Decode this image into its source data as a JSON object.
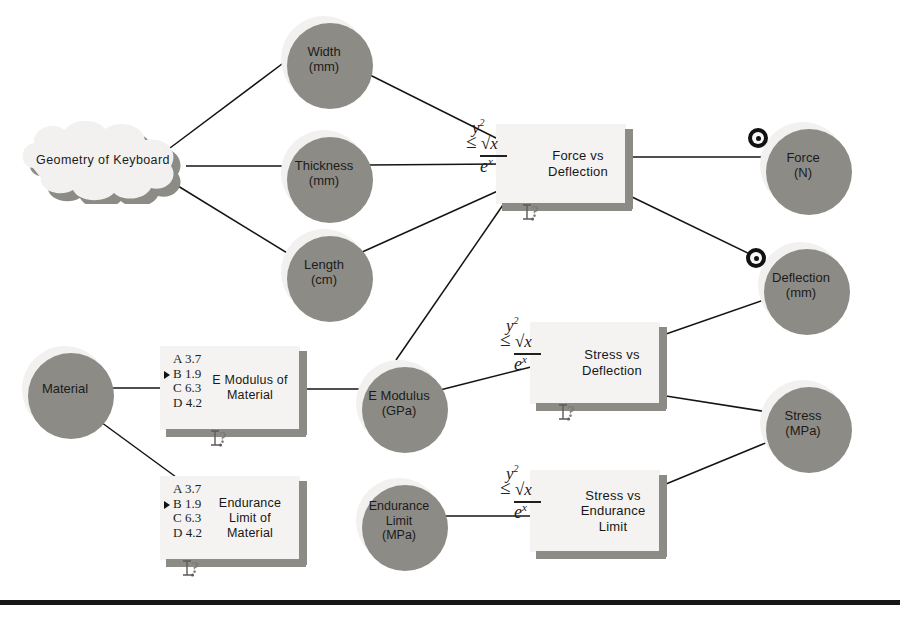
{
  "diagram": {
    "bottom_rule_y": 600,
    "colors": {
      "node_fill": "#f2f1ef",
      "shadow": "#8d8b86",
      "edge": "#141414",
      "text": "#1b1b1b",
      "rule": "#161616"
    },
    "icons": {
      "equation": {
        "name": "equation-icon",
        "numerator_left": "y",
        "numerator_sup": "2",
        "relation": "≤",
        "radical": "√",
        "radicand": "x",
        "denominator": "e",
        "denominator_sup": "x"
      },
      "option_list": {
        "name": "option-list-icon",
        "options": [
          {
            "letter": "A",
            "value": "3.7",
            "selected": false
          },
          {
            "letter": "B",
            "value": "1.9",
            "selected": true
          },
          {
            "letter": "C",
            "value": "6.3",
            "selected": false
          },
          {
            "letter": "D",
            "value": "4.2",
            "selected": false
          }
        ]
      },
      "help": {
        "name": "help-cursor-icon",
        "glyph": "?"
      },
      "target": {
        "name": "target-icon"
      }
    },
    "cloud_nodes": [
      {
        "id": "geometry",
        "name": "node-geometry-of-keyboard",
        "label": "Geometry  of  Keyboard",
        "x": 14,
        "y": 116,
        "w": 178,
        "h": 88,
        "font_size": 12.5
      }
    ],
    "circle_nodes": [
      {
        "id": "width",
        "name": "node-width",
        "label": "Width\n(mm)",
        "x": 281,
        "y": 16,
        "d": 86,
        "font_size": 13
      },
      {
        "id": "thickness",
        "name": "node-thickness",
        "label": "Thickness\n(mm)",
        "x": 281,
        "y": 130,
        "d": 86,
        "font_size": 13
      },
      {
        "id": "length",
        "name": "node-length",
        "label": "Length\n(cm)",
        "x": 281,
        "y": 229,
        "d": 86,
        "font_size": 13
      },
      {
        "id": "force",
        "name": "node-force",
        "label": "Force\n(N)",
        "x": 760,
        "y": 122,
        "d": 86,
        "font_size": 13,
        "target": true
      },
      {
        "id": "deflection",
        "name": "node-deflection",
        "label": "Deflection\n(mm)",
        "x": 758,
        "y": 242,
        "d": 86,
        "font_size": 13,
        "target": true
      },
      {
        "id": "emodulus",
        "name": "node-e-modulus",
        "label": "E Modulus\n(GPa)",
        "x": 356,
        "y": 360,
        "d": 86,
        "font_size": 13
      },
      {
        "id": "stress",
        "name": "node-stress",
        "label": "Stress\n(MPa)",
        "x": 760,
        "y": 380,
        "d": 86,
        "font_size": 13
      },
      {
        "id": "endlimit",
        "name": "node-endurance-limit",
        "label": "Endurance\nLimit\n(MPa)",
        "x": 356,
        "y": 478,
        "d": 86,
        "font_size": 12.5
      }
    ],
    "box_nodes": [
      {
        "id": "force_vs_deflection",
        "name": "box-force-vs-deflection",
        "label": "Force vs\nDeflection",
        "x": 496,
        "y": 124,
        "w": 130,
        "h": 80,
        "font_size": 13,
        "label_offset_x": 38,
        "icon": "equation",
        "help": true,
        "help_x": 24
      },
      {
        "id": "e_modulus_of_material",
        "name": "box-e-modulus-of-material",
        "label": "E Modulus of\nMaterial",
        "x": 160,
        "y": 346,
        "w": 140,
        "h": 84,
        "font_size": 12.5,
        "label_offset_x": 44,
        "icon": "option_list",
        "help": true,
        "help_x": 48
      },
      {
        "id": "stress_vs_deflection",
        "name": "box-stress-vs-deflection",
        "label": "Stress vs\nDeflection",
        "x": 530,
        "y": 322,
        "w": 130,
        "h": 82,
        "font_size": 13,
        "label_offset_x": 38,
        "icon": "equation",
        "help": true,
        "help_x": 26
      },
      {
        "id": "endurance_limit_of_material",
        "name": "box-endurance-limit-of-material",
        "label": "Endurance\nLimit of\nMaterial",
        "x": 160,
        "y": 476,
        "w": 140,
        "h": 84,
        "font_size": 12.5,
        "label_offset_x": 44,
        "icon": "option_list",
        "help": true,
        "help_x": 20
      },
      {
        "id": "stress_vs_endurance_limit",
        "name": "box-stress-vs-endurance-limit",
        "label": "Stress vs\nEndurance\nLimit",
        "x": 530,
        "y": 470,
        "w": 130,
        "h": 82,
        "font_size": 13,
        "label_offset_x": 40,
        "icon": "equation",
        "help": false,
        "help_x": 0
      }
    ],
    "edges": [
      {
        "name": "edge-geometry-width",
        "x1": 170,
        "y1": 148,
        "x2": 290,
        "y2": 58
      },
      {
        "name": "edge-geometry-thickness",
        "x1": 186,
        "y1": 166,
        "x2": 283,
        "y2": 166
      },
      {
        "name": "edge-geometry-length",
        "x1": 178,
        "y1": 186,
        "x2": 292,
        "y2": 256
      },
      {
        "name": "edge-width-force-vs-deflection",
        "x1": 360,
        "y1": 70,
        "x2": 500,
        "y2": 140
      },
      {
        "name": "edge-thickness-force-vs-deflection",
        "x1": 368,
        "y1": 165,
        "x2": 500,
        "y2": 164
      },
      {
        "name": "edge-length-force-vs-deflection",
        "x1": 360,
        "y1": 253,
        "x2": 500,
        "y2": 190
      },
      {
        "name": "edge-emodulus-force-vs-deflection",
        "x1": 396,
        "y1": 360,
        "x2": 505,
        "y2": 202
      },
      {
        "name": "edge-force-vs-deflection-force",
        "x1": 632,
        "y1": 157,
        "x2": 768,
        "y2": 157
      },
      {
        "name": "edge-force-vs-deflection-deflection",
        "x1": 630,
        "y1": 196,
        "x2": 756,
        "y2": 257
      },
      {
        "name": "edge-material-e-modulus-of-material",
        "x1": 100,
        "y1": 388,
        "x2": 165,
        "y2": 388
      },
      {
        "name": "edge-material-endurance-limit",
        "x1": 94,
        "y1": 417,
        "x2": 176,
        "y2": 477
      },
      {
        "name": "edge-e-modulus-of-material-emodulus",
        "x1": 306,
        "y1": 389,
        "x2": 360,
        "y2": 389
      },
      {
        "name": "edge-emodulus-stress-vs-deflection",
        "x1": 440,
        "y1": 390,
        "x2": 535,
        "y2": 366
      },
      {
        "name": "edge-deflection-stress-vs-deflection",
        "x1": 666,
        "y1": 334,
        "x2": 764,
        "y2": 300
      },
      {
        "name": "edge-stress-vs-deflection-stress",
        "x1": 666,
        "y1": 396,
        "x2": 768,
        "y2": 412
      },
      {
        "name": "edge-endlimit-stress-vs-endurance",
        "x1": 440,
        "y1": 516,
        "x2": 535,
        "y2": 516
      },
      {
        "name": "edge-stress-vs-endurance-stress",
        "x1": 666,
        "y1": 484,
        "x2": 768,
        "y2": 442
      }
    ],
    "material_node": {
      "id": "material",
      "name": "node-material",
      "label": "Material",
      "x": 22,
      "y": 346,
      "d": 86,
      "font_size": 13
    }
  }
}
